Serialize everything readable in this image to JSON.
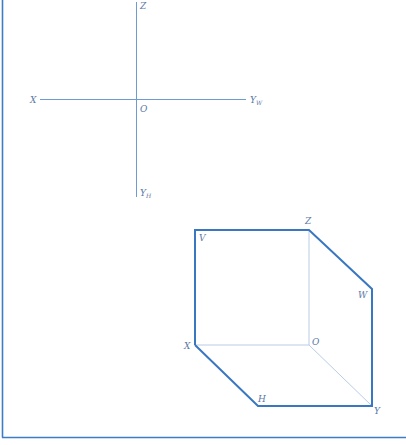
{
  "colors": {
    "frame": "#3e7cc4",
    "axis": "#6f9bd2",
    "cube_edge": "#3a77c2",
    "cube_inner": "#b9cde6",
    "label": "#5a78a6"
  },
  "axes_diagram": {
    "labels": {
      "z": "Z",
      "x": "X",
      "origin": "O",
      "yw_main": "Y",
      "yw_sub": "W",
      "yh_main": "Y",
      "yh_sub": "H"
    }
  },
  "cube_diagram": {
    "labels": {
      "v": "V",
      "z": "Z",
      "w": "W",
      "x": "X",
      "o": "O",
      "h": "H",
      "y": "Y"
    }
  }
}
